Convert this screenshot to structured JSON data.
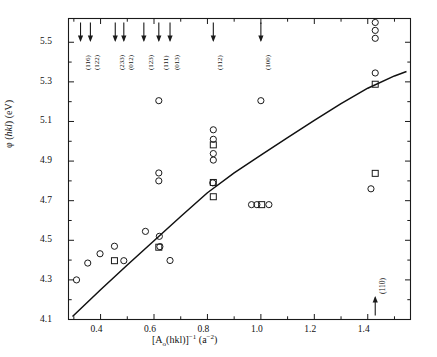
{
  "chart_data": {
    "type": "scatter",
    "title": "",
    "xlabel": "[A0(hkl)]^-1 (a^-2)",
    "xlabel_parts": {
      "pre": "[A",
      "sub": "o",
      "mid": "(hkl)]",
      "sup": "−1",
      "unit_pre": " (a",
      "unit_sup": "−2",
      "unit_post": ")"
    },
    "ylabel": "φ (hkl) (eV)",
    "ylabel_parts": {
      "pre": "φ (",
      "ital": "hkl",
      "post": ") (eV)"
    },
    "xlim": [
      0.28,
      1.56
    ],
    "ylim": [
      4.1,
      5.62
    ],
    "xticks": [
      0.4,
      0.6,
      0.8,
      1.0,
      1.2,
      1.4
    ],
    "xticklabels": [
      "0.4",
      "0.6",
      "0.8",
      "1.0",
      "1.2",
      "1.4"
    ],
    "xminorticks": [
      0.3,
      0.5,
      0.7,
      0.9,
      1.1,
      1.3,
      1.5
    ],
    "yticks": [
      4.1,
      4.3,
      4.5,
      4.7,
      4.9,
      5.1,
      5.3,
      5.5
    ],
    "yticklabels": [
      "4.1",
      "4.3",
      "4.5",
      "4.7",
      "4.9",
      "5.1",
      "5.3",
      "5.5"
    ],
    "grid": false,
    "legend": "none",
    "top_arrows": [
      {
        "label": "(116)",
        "x": 0.325
      },
      {
        "label": "(122)",
        "x": 0.362
      },
      {
        "label": "(233)",
        "x": 0.455
      },
      {
        "label": "(012)",
        "x": 0.487
      },
      {
        "label": "(123)",
        "x": 0.562
      },
      {
        "label": "(111)",
        "x": 0.618
      },
      {
        "label": "(013)",
        "x": 0.66
      },
      {
        "label": "(112)",
        "x": 0.822
      },
      {
        "label": "(100)",
        "x": 1.0
      }
    ],
    "bottom_arrows": [
      {
        "label": "(110)",
        "x": 1.428
      }
    ],
    "series": [
      {
        "name": "open-circles",
        "marker": "circle",
        "points": [
          {
            "x": 0.31,
            "y": 4.3
          },
          {
            "x": 0.352,
            "y": 4.385
          },
          {
            "x": 0.398,
            "y": 4.432
          },
          {
            "x": 0.452,
            "y": 4.47
          },
          {
            "x": 0.487,
            "y": 4.397
          },
          {
            "x": 0.568,
            "y": 4.545
          },
          {
            "x": 0.618,
            "y": 5.205
          },
          {
            "x": 0.618,
            "y": 4.84
          },
          {
            "x": 0.618,
            "y": 4.8
          },
          {
            "x": 0.62,
            "y": 4.52
          },
          {
            "x": 0.622,
            "y": 4.468
          },
          {
            "x": 0.66,
            "y": 4.398
          },
          {
            "x": 0.822,
            "y": 5.058
          },
          {
            "x": 0.822,
            "y": 5.01
          },
          {
            "x": 0.822,
            "y": 4.938
          },
          {
            "x": 0.822,
            "y": 4.905
          },
          {
            "x": 0.82,
            "y": 4.79
          },
          {
            "x": 0.965,
            "y": 4.68
          },
          {
            "x": 0.985,
            "y": 4.68
          },
          {
            "x": 1.03,
            "y": 4.68
          },
          {
            "x": 1.0,
            "y": 5.205
          },
          {
            "x": 1.428,
            "y": 5.6
          },
          {
            "x": 1.428,
            "y": 5.56
          },
          {
            "x": 1.428,
            "y": 5.52
          },
          {
            "x": 1.428,
            "y": 5.345
          },
          {
            "x": 1.412,
            "y": 4.76
          }
        ]
      },
      {
        "name": "open-squares",
        "marker": "square",
        "points": [
          {
            "x": 0.452,
            "y": 4.397
          },
          {
            "x": 0.618,
            "y": 4.465
          },
          {
            "x": 0.822,
            "y": 4.982
          },
          {
            "x": 0.822,
            "y": 4.792
          },
          {
            "x": 0.822,
            "y": 4.72
          },
          {
            "x": 1.003,
            "y": 4.68
          },
          {
            "x": 1.428,
            "y": 5.288
          },
          {
            "x": 1.428,
            "y": 4.838
          }
        ]
      },
      {
        "name": "fit-curve",
        "marker": "line",
        "points": [
          {
            "x": 0.295,
            "y": 4.115
          },
          {
            "x": 0.4,
            "y": 4.25
          },
          {
            "x": 0.5,
            "y": 4.375
          },
          {
            "x": 0.6,
            "y": 4.498
          },
          {
            "x": 0.7,
            "y": 4.62
          },
          {
            "x": 0.8,
            "y": 4.74
          },
          {
            "x": 0.9,
            "y": 4.84
          },
          {
            "x": 1.0,
            "y": 4.93
          },
          {
            "x": 1.1,
            "y": 5.018
          },
          {
            "x": 1.2,
            "y": 5.105
          },
          {
            "x": 1.3,
            "y": 5.19
          },
          {
            "x": 1.4,
            "y": 5.268
          },
          {
            "x": 1.5,
            "y": 5.33
          },
          {
            "x": 1.545,
            "y": 5.352
          }
        ]
      }
    ]
  }
}
